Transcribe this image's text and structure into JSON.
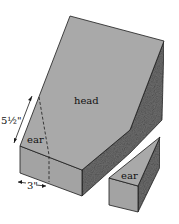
{
  "diagram": {
    "labels": {
      "head": "head",
      "ear_on_block": "ear",
      "ear_piece": "ear",
      "height_dim": "5½\"",
      "width_dim": "3\""
    },
    "colors": {
      "top_face": "#a9a9a9",
      "front_face": "#a3a3a3",
      "side_face": "#6f6f6f",
      "edge": "#1a1a1a",
      "background": "#ffffff"
    }
  }
}
